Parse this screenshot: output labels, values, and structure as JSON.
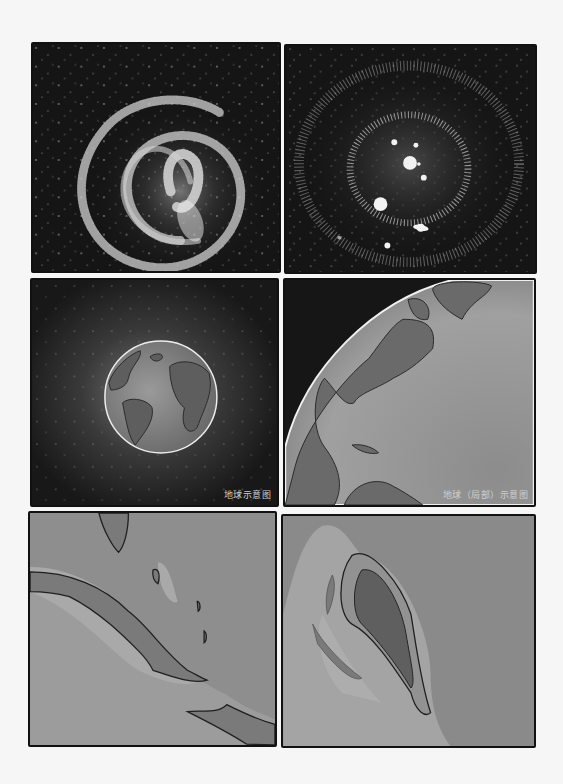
{
  "page": {
    "type": "comic-page",
    "layout": "3 rows x 2 columns",
    "colors": {
      "background": "#f6f6f6",
      "space": "#161616",
      "ocean": "#8a8a8a",
      "land": "#6e6e6e",
      "shallow": "#a6a6a6",
      "border": "#111111"
    }
  },
  "panels": [
    {
      "id": "galaxy",
      "description": "spiral galaxy with star field",
      "caption": ""
    },
    {
      "id": "solar-system",
      "description": "star cluster / solar system with planets and ringed planet",
      "caption": ""
    },
    {
      "id": "earth",
      "description": "Earth globe in space",
      "caption": "地球示意图"
    },
    {
      "id": "earth-partial",
      "description": "close-up of Earth's limb showing North America and Greenland",
      "caption": "地球（局部）示意图"
    },
    {
      "id": "caribbean",
      "description": "map of Cuba and Caribbean islands",
      "caption": ""
    },
    {
      "id": "island",
      "description": "single island with shallow reef surroundings",
      "caption": ""
    }
  ]
}
